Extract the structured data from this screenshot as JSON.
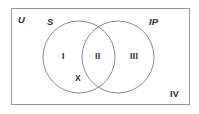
{
  "figure": {
    "background_color": "#ffffff",
    "stroke_color": "#8c8c8c",
    "text_color": "#2b2b2b"
  },
  "universe": {
    "label": "U",
    "rect": {
      "x": 11,
      "y": 8,
      "width": 179,
      "height": 97
    }
  },
  "sets": [
    {
      "name": "S",
      "label": "S",
      "circle": {
        "cx": 79,
        "cy": 57,
        "r": 36
      }
    },
    {
      "name": "IP",
      "label": "IP",
      "circle": {
        "cx": 118,
        "cy": 57,
        "r": 36
      }
    }
  ],
  "regions": [
    {
      "id": "I",
      "label": "I",
      "meaning": "S only"
    },
    {
      "id": "II",
      "label": "II",
      "meaning": "S and IP intersection"
    },
    {
      "id": "III",
      "label": "III",
      "meaning": "IP only"
    },
    {
      "id": "IV",
      "label": "IV",
      "meaning": "outside both sets, inside U"
    }
  ],
  "points": [
    {
      "id": "X",
      "label": "X",
      "location": "region I, lower area of set S"
    }
  ]
}
